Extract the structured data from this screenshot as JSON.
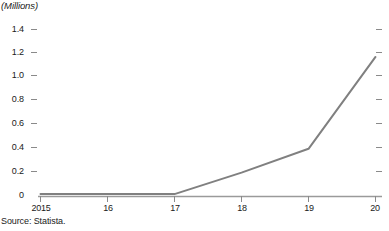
{
  "chart_data": {
    "type": "line",
    "title": "(Millions)",
    "xlabel": "",
    "ylabel": "",
    "categories": [
      "2015",
      "16",
      "17",
      "18",
      "19",
      "20"
    ],
    "x": [
      2015,
      2016,
      2017,
      2018,
      2019,
      2020
    ],
    "values": [
      0.02,
      0.02,
      0.02,
      0.2,
      0.4,
      1.17
    ],
    "series": [
      {
        "name": "",
        "values": [
          0.02,
          0.02,
          0.02,
          0.2,
          0.4,
          1.17
        ]
      }
    ],
    "ylim": [
      0,
      1.4
    ],
    "yticks": [
      0,
      0.2,
      0.4,
      0.6,
      0.8,
      1.0,
      1.2,
      1.4
    ],
    "ytick_labels": [
      "0",
      "0.2",
      "0.4",
      "0.6",
      "0.8",
      "1.0",
      "1.2",
      "1.4"
    ],
    "xtick_labels": [
      "2015",
      "16",
      "17",
      "18",
      "19",
      "20"
    ],
    "grid": false,
    "legend": "none",
    "line_color": "#808080",
    "axis_color": "#9a9a9a",
    "text_color": "#1a1a1a",
    "right_ticks": true
  },
  "footer": {
    "source": "Source: Statista."
  }
}
